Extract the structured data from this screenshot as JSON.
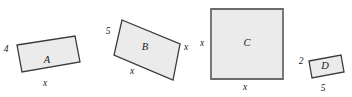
{
  "figure": {
    "background_color": "#ffffff",
    "fill_color": "#ebebeb",
    "stroke_color": "#3b3b3b",
    "label_color": "#1a1a1a",
    "shapes": [
      {
        "id": "A",
        "name": "rectangle-a",
        "label": "A",
        "label_pos": {
          "x": 47,
          "y": 63
        },
        "points": "17,45 75,36 80,62 22,72",
        "stroke_width": 1.3,
        "dimensions": [
          {
            "name": "height",
            "text": "4",
            "x": 6,
            "y": 52
          },
          {
            "name": "width",
            "text": "x",
            "x": 45,
            "y": 86
          }
        ]
      },
      {
        "id": "B",
        "name": "rectangle-b",
        "label": "B",
        "label_pos": {
          "x": 145,
          "y": 50
        },
        "points": "122,20 180,44 173,80 114,55",
        "stroke_width": 1.3,
        "dimensions": [
          {
            "name": "height",
            "text": "5",
            "x": 108,
            "y": 34
          },
          {
            "name": "width",
            "text": "x",
            "x": 132,
            "y": 74
          },
          {
            "name": "side",
            "text": "x",
            "x": 186,
            "y": 50
          }
        ]
      },
      {
        "id": "C",
        "name": "square-c",
        "label": "C",
        "label_pos": {
          "x": 247,
          "y": 46
        },
        "points": "211,9 283,9 283,79 211,79",
        "stroke_width": 1.6,
        "dimensions": [
          {
            "name": "height",
            "text": "x",
            "x": 202,
            "y": 46
          },
          {
            "name": "width",
            "text": "x",
            "x": 245,
            "y": 90
          }
        ]
      },
      {
        "id": "D",
        "name": "rectangle-d",
        "label": "D",
        "label_pos": {
          "x": 325,
          "y": 69
        },
        "points": "309,61 341,55 344,72 312,78",
        "stroke_width": 1.3,
        "dimensions": [
          {
            "name": "height",
            "text": "2",
            "x": 301,
            "y": 64
          },
          {
            "name": "width",
            "text": "5",
            "x": 323,
            "y": 91
          }
        ]
      }
    ]
  }
}
